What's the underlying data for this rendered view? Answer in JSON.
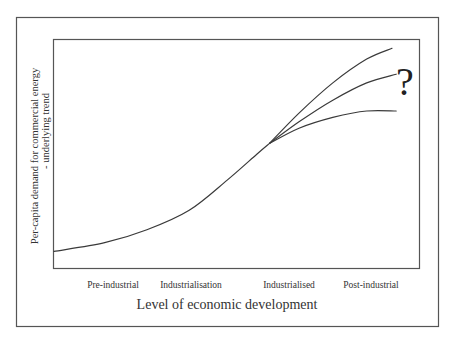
{
  "chart_data": {
    "type": "line",
    "title": "",
    "xlabel": "Level of economic development",
    "ylabel_lines": [
      "Per-capita demand for commercial energy",
      "- underlying trend"
    ],
    "categories": [
      "Pre-industrial",
      "Industrialisation",
      "Industrialised",
      "Post-industrial"
    ],
    "annotation": "?",
    "x_range": [
      0,
      4
    ],
    "y_range": [
      0,
      1
    ],
    "grid": false,
    "legend": "none",
    "trunk": {
      "name": "underlying trend",
      "points": [
        [
          0.0,
          0.04
        ],
        [
          0.6,
          0.08
        ],
        [
          1.1,
          0.14
        ],
        [
          1.6,
          0.23
        ],
        [
          2.05,
          0.37
        ],
        [
          2.4,
          0.49
        ],
        [
          2.55,
          0.54
        ]
      ]
    },
    "series": [
      {
        "name": "high scenario",
        "points": [
          [
            2.55,
            0.54
          ],
          [
            2.9,
            0.68
          ],
          [
            3.3,
            0.82
          ],
          [
            3.7,
            0.93
          ],
          [
            4.0,
            0.98
          ]
        ]
      },
      {
        "name": "medium scenario",
        "points": [
          [
            2.55,
            0.54
          ],
          [
            2.9,
            0.64
          ],
          [
            3.3,
            0.74
          ],
          [
            3.7,
            0.82
          ],
          [
            4.05,
            0.86
          ]
        ]
      },
      {
        "name": "low scenario",
        "points": [
          [
            2.55,
            0.54
          ],
          [
            2.9,
            0.61
          ],
          [
            3.3,
            0.66
          ],
          [
            3.7,
            0.69
          ],
          [
            4.05,
            0.69
          ]
        ]
      }
    ]
  }
}
